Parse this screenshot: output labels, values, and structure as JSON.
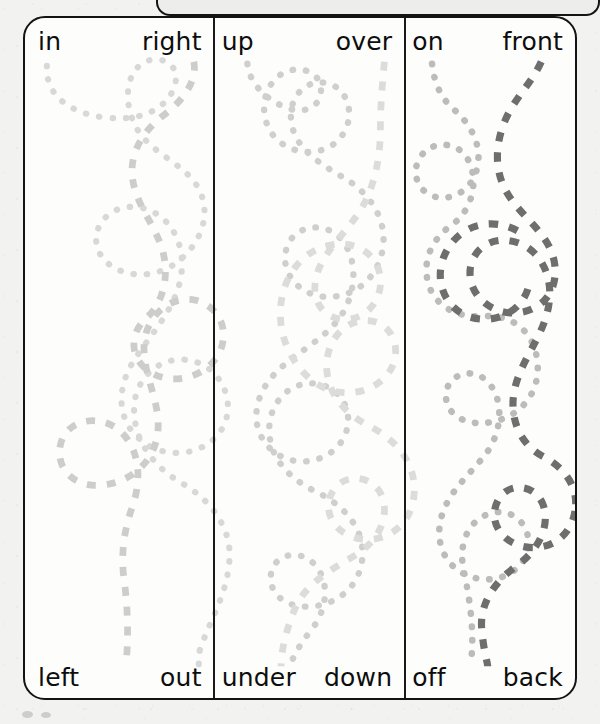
{
  "worksheet": {
    "type": "preposition-tracing-maze-worksheet",
    "columns": [
      {
        "id": "column-1",
        "top_left_word": "in",
        "top_right_word": "right",
        "bottom_left_word": "left",
        "bottom_right_word": "out",
        "paths": [
          {
            "id": "c1-dotted",
            "style": "dotted",
            "color": "#d6d6d6",
            "from": "in",
            "to": "out"
          },
          {
            "id": "c1-dashed",
            "style": "dashed",
            "color": "#cfcfcf",
            "from": "right",
            "to": "left"
          }
        ]
      },
      {
        "id": "column-2",
        "top_left_word": "up",
        "top_right_word": "over",
        "bottom_left_word": "under",
        "bottom_right_word": "down",
        "paths": [
          {
            "id": "c2-dotted",
            "style": "dotted",
            "color": "#cdcdcd",
            "from": "up",
            "to": "down"
          },
          {
            "id": "c2-dashed",
            "style": "dashed",
            "color": "#dddddd",
            "from": "over",
            "to": "under"
          }
        ]
      },
      {
        "id": "column-3",
        "top_left_word": "on",
        "top_right_word": "front",
        "bottom_left_word": "off",
        "bottom_right_word": "back",
        "paths": [
          {
            "id": "c3-dotted",
            "style": "dotted",
            "color": "#b9b9b9",
            "from": "on",
            "to": "off"
          },
          {
            "id": "c3-dashed",
            "style": "dashed",
            "color": "#6c6c6c",
            "from": "front",
            "to": "back"
          }
        ]
      }
    ],
    "colors": {
      "border": "#131313",
      "divider": "#191919",
      "paper": "#f2f2f0",
      "card_background": "#fdfdfc",
      "word_text": "#0d0d0d"
    }
  }
}
